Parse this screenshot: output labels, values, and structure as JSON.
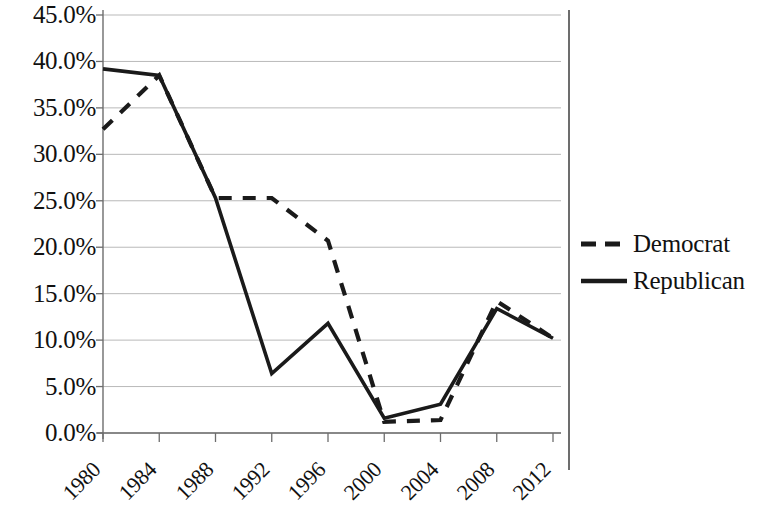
{
  "chart_data": {
    "type": "line",
    "title": "",
    "xlabel": "",
    "ylabel": "",
    "grid": true,
    "legend_position": "right",
    "x": [
      1980,
      1984,
      1988,
      1992,
      1996,
      2000,
      2004,
      2008,
      2012
    ],
    "categories": [
      "1980",
      "1984",
      "1988",
      "1992",
      "1996",
      "2000",
      "2004",
      "2008",
      "2012"
    ],
    "xlim": [
      1980,
      2012
    ],
    "ylim": [
      0,
      45
    ],
    "y_unit": "%",
    "y_ticks": [
      0,
      5,
      10,
      15,
      20,
      25,
      30,
      35,
      40,
      45
    ],
    "y_tick_labels": [
      "0.0%",
      "5.0%",
      "10.0%",
      "15.0%",
      "20.0%",
      "25.0%",
      "30.0%",
      "35.0%",
      "40.0%",
      "45.0%"
    ],
    "series": [
      {
        "name": "Democrat",
        "style": "dashed",
        "color": "#1a1a1a",
        "values": [
          32.7,
          38.5,
          25.3,
          25.3,
          20.7,
          1.2,
          1.4,
          14.2,
          10.2
        ]
      },
      {
        "name": "Republican",
        "style": "solid",
        "color": "#1a1a1a",
        "values": [
          39.2,
          38.5,
          25.3,
          6.4,
          11.8,
          1.6,
          3.1,
          13.4,
          10.2
        ]
      }
    ]
  },
  "legend": {
    "items": [
      {
        "label": "Democrat",
        "style": "dashed"
      },
      {
        "label": "Republican",
        "style": "solid"
      }
    ]
  },
  "axis_colors": {
    "gridline": "#b9b9b9",
    "axis": "#6d6d6d",
    "series": "#1a1a1a"
  }
}
